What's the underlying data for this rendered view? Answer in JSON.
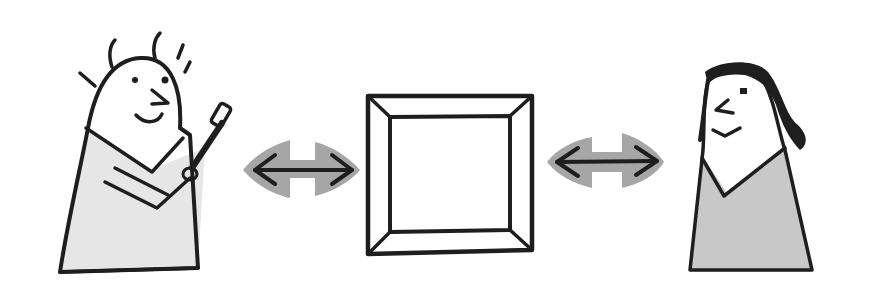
{
  "illustration": {
    "description": "Hand-drawn sketch: an artist holding a paintbrush, a double-headed arrow, a blank picture frame, another double-headed arrow, and a viewer",
    "colors": {
      "background": "#ffffff",
      "ink": "#1e1e1e",
      "left_body_fill": "#e6e6e6",
      "right_body_fill": "#c8c8c8",
      "arrow_halo": "#a6a6a6"
    },
    "elements": [
      {
        "name": "artist-figure",
        "holds": "paintbrush-icon"
      },
      {
        "name": "left-double-arrow"
      },
      {
        "name": "empty-frame"
      },
      {
        "name": "right-double-arrow"
      },
      {
        "name": "viewer-figure"
      }
    ]
  }
}
